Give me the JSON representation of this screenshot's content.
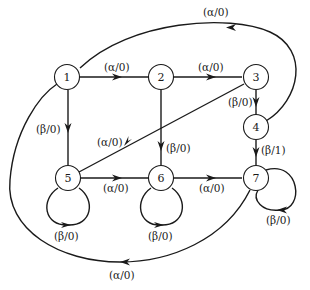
{
  "diagram": {
    "type": "state-transition-graph",
    "nodes": [
      {
        "id": "1",
        "label": "1"
      },
      {
        "id": "2",
        "label": "2"
      },
      {
        "id": "3",
        "label": "3"
      },
      {
        "id": "4",
        "label": "4"
      },
      {
        "id": "5",
        "label": "5"
      },
      {
        "id": "6",
        "label": "6"
      },
      {
        "id": "7",
        "label": "7"
      }
    ],
    "edges": [
      {
        "from": "1",
        "to": "2",
        "label": "(α/0)"
      },
      {
        "from": "2",
        "to": "3",
        "label": "(α/0)"
      },
      {
        "from": "4",
        "to": "1",
        "label": "(α/0)"
      },
      {
        "from": "3",
        "to": "4",
        "label": "(β/0)"
      },
      {
        "from": "1",
        "to": "5",
        "label": "(β/0)"
      },
      {
        "from": "3",
        "to": "5",
        "label": "(α/0)"
      },
      {
        "from": "2",
        "to": "6",
        "label": "(β/0)"
      },
      {
        "from": "4",
        "to": "7",
        "label": "(β/1)"
      },
      {
        "from": "5",
        "to": "6",
        "label": "(α/0)"
      },
      {
        "from": "6",
        "to": "7",
        "label": "(α/0)"
      },
      {
        "from": "5",
        "to": "5",
        "label": "(β/0)"
      },
      {
        "from": "6",
        "to": "6",
        "label": "(β/0)"
      },
      {
        "from": "7",
        "to": "7",
        "label": "(β/0)"
      },
      {
        "from": "7",
        "to": "1",
        "label": "(α/0)"
      }
    ]
  }
}
